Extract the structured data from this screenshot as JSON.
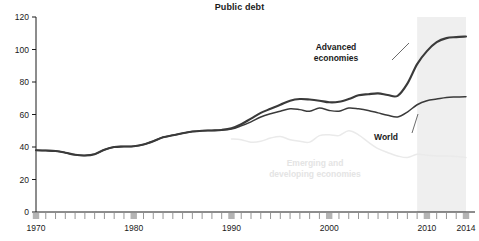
{
  "chart_data": {
    "type": "line",
    "title": "Public debt",
    "xlabel": "",
    "ylabel": "",
    "xlim": [
      1970,
      2014
    ],
    "ylim": [
      0,
      120
    ],
    "grid": false,
    "legend_position": "inline-annotations",
    "xticks": [
      1970,
      1980,
      1990,
      2000,
      2010,
      2014
    ],
    "xtick_labels": [
      "1970",
      "1980",
      "1990",
      "2000",
      "2010",
      "2014"
    ],
    "yticks": [
      0,
      20,
      40,
      60,
      80,
      100,
      120
    ],
    "ytick_labels": [
      "0",
      "20",
      "40",
      "60",
      "80",
      "100",
      "120"
    ],
    "minor_xtick_interval": 1,
    "shaded_region": {
      "label": "projection",
      "x_start": 2009,
      "x_end": 2014,
      "color": "#efefef"
    },
    "x": [
      1970,
      1971,
      1972,
      1973,
      1974,
      1975,
      1976,
      1977,
      1978,
      1979,
      1980,
      1981,
      1982,
      1983,
      1984,
      1985,
      1986,
      1987,
      1988,
      1989,
      1990,
      1991,
      1992,
      1993,
      1994,
      1995,
      1996,
      1997,
      1998,
      1999,
      2000,
      2001,
      2002,
      2003,
      2004,
      2005,
      2006,
      2007,
      2008,
      2009,
      2010,
      2011,
      2012,
      2013,
      2014
    ],
    "series": [
      {
        "name": "Advanced economies",
        "color": "#3a3a3a",
        "width": 2.1,
        "values": [
          38.0,
          37.8,
          37.5,
          36.5,
          35.2,
          34.8,
          35.6,
          38.3,
          40.0,
          40.3,
          40.5,
          41.5,
          43.5,
          46.0,
          47.2,
          48.5,
          49.5,
          50.0,
          50.2,
          50.5,
          51.5,
          54.0,
          57.5,
          61.0,
          63.5,
          66.0,
          68.5,
          69.5,
          69.2,
          68.5,
          67.5,
          67.8,
          69.5,
          71.8,
          72.5,
          73.0,
          72.0,
          71.5,
          79.0,
          91.0,
          99.0,
          104.5,
          107.0,
          107.6,
          108.0
        ]
      },
      {
        "name": "World",
        "color": "#3a3a3a",
        "width": 1.5,
        "values": [
          38.0,
          37.8,
          37.5,
          36.5,
          35.2,
          34.8,
          35.6,
          38.3,
          40.0,
          40.3,
          40.5,
          41.5,
          43.5,
          46.0,
          47.2,
          48.5,
          49.5,
          50.0,
          50.2,
          50.5,
          51.0,
          53.0,
          55.5,
          58.5,
          60.5,
          62.0,
          63.5,
          63.0,
          62.0,
          64.0,
          62.5,
          62.0,
          64.0,
          63.5,
          62.5,
          61.0,
          59.5,
          58.5,
          61.5,
          66.0,
          68.5,
          69.5,
          70.5,
          70.8,
          71.0
        ]
      },
      {
        "name": "Emerging and developing economies",
        "color": "#eaeaea",
        "width": 1.5,
        "values": [
          null,
          null,
          null,
          null,
          null,
          null,
          null,
          null,
          null,
          null,
          null,
          null,
          null,
          null,
          null,
          null,
          null,
          null,
          null,
          null,
          45.0,
          44.5,
          43.0,
          43.5,
          45.5,
          46.5,
          44.5,
          43.5,
          43.0,
          47.0,
          47.5,
          47.0,
          50.0,
          47.5,
          43.0,
          39.0,
          36.5,
          34.5,
          33.5,
          35.5,
          35.0,
          34.5,
          34.5,
          34.2,
          33.5
        ]
      }
    ],
    "annotations": [
      {
        "name": "advanced-economies-label",
        "text_lines": [
          "Advanced",
          "economies"
        ],
        "x": 336,
        "y": 50,
        "style": "dark",
        "leader": {
          "x1": 392,
          "y1": 60,
          "x2": 409,
          "y2": 43
        }
      },
      {
        "name": "world-label",
        "text_lines": [
          "World"
        ],
        "x": 386,
        "y": 140,
        "style": "dark",
        "leader": {
          "x1": 412,
          "y1": 133,
          "x2": 418,
          "y2": 114
        }
      },
      {
        "name": "emerging-economies-label",
        "text_lines": [
          "Emerging and",
          "developing economies"
        ],
        "x": 315,
        "y": 166,
        "style": "light",
        "leader": null
      }
    ]
  }
}
